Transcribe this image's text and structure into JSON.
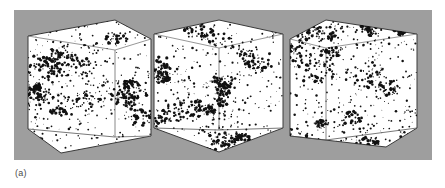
{
  "figure": {
    "caption": "(a)",
    "panel_background": "#9e9e9e",
    "page_background": "#ffffff",
    "cube_face_color": "#ffffff",
    "cube_edge_color": "#3a3a3a",
    "particle_color": "#111111",
    "panel": {
      "x": 14,
      "y": 10,
      "width": 418,
      "height": 150
    },
    "cubes": [
      {
        "id": "cube-1",
        "label": "simulation-cube-left",
        "view": "three-quarter-left",
        "description": "Cube of simulated galaxy distribution viewed from upper-left, showing clustered filamentary large-scale structure"
      },
      {
        "id": "cube-2",
        "label": "simulation-cube-middle",
        "view": "corner-on",
        "description": "Cube of simulated galaxy distribution viewed corner-on, showing clustered filamentary large-scale structure"
      },
      {
        "id": "cube-3",
        "label": "simulation-cube-right",
        "view": "three-quarter-right",
        "description": "Cube of simulated galaxy distribution viewed from upper-right, showing clustered filamentary large-scale structure"
      }
    ]
  },
  "chart_data": {
    "type": "scatter",
    "title": "",
    "subtitle": "",
    "xlabel": "",
    "ylabel": "",
    "grid": false,
    "legend": null,
    "panels": [
      {
        "name": "cube-1",
        "projection": "3d-cube-wireframe",
        "n_points": 900,
        "seed": 11,
        "cluster_seeds": 16,
        "notes": "Point cloud with dense knots and filaments; strongest concentration lower-center-right"
      },
      {
        "name": "cube-2",
        "projection": "3d-cube-wireframe",
        "n_points": 900,
        "seed": 29,
        "cluster_seeds": 16,
        "notes": "Point cloud with dense knots and filaments; strongest concentration near bottom-center vertex"
      },
      {
        "name": "cube-3",
        "projection": "3d-cube-wireframe",
        "n_points": 900,
        "seed": 47,
        "cluster_seeds": 16,
        "notes": "Point cloud with dense knots and filaments; strongest concentration mid-right"
      }
    ]
  }
}
